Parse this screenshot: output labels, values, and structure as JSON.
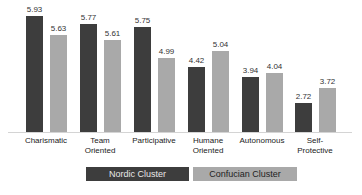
{
  "chart_data": {
    "type": "bar",
    "title": "",
    "xlabel": "",
    "ylabel": "",
    "categories": [
      "Charismatic",
      "Team Oriented",
      "Participative",
      "Humane Oriented",
      "Autonomous",
      "Self-Protective"
    ],
    "category_lines": [
      [
        "Charismatic"
      ],
      [
        "Team",
        "Oriented"
      ],
      [
        "Participative"
      ],
      [
        "Humane",
        "Oriented"
      ],
      [
        "Autonomous"
      ],
      [
        "Self-",
        "Protective"
      ]
    ],
    "series": [
      {
        "name": "Nordic Cluster",
        "color": "#3d3d3d",
        "values": [
          5.93,
          5.77,
          5.75,
          4.42,
          3.94,
          2.72
        ]
      },
      {
        "name": "Confucian Cluster",
        "color": "#a9a9a9",
        "values": [
          5.63,
          5.61,
          4.99,
          5.04,
          4.04,
          3.72
        ]
      }
    ],
    "value_labels": {
      "nordic": [
        "5.93",
        "5.77",
        "5.75",
        "4.42",
        "3.94",
        "2.72"
      ],
      "confucian": [
        "5.63",
        "5.61",
        "4.99",
        "5.04",
        "4.04",
        "3.72"
      ]
    },
    "legend_position": "bottom",
    "grid": false
  },
  "legend": {
    "nordic_label": "Nordic Cluster",
    "confucian_label": "Confucian Cluster"
  }
}
